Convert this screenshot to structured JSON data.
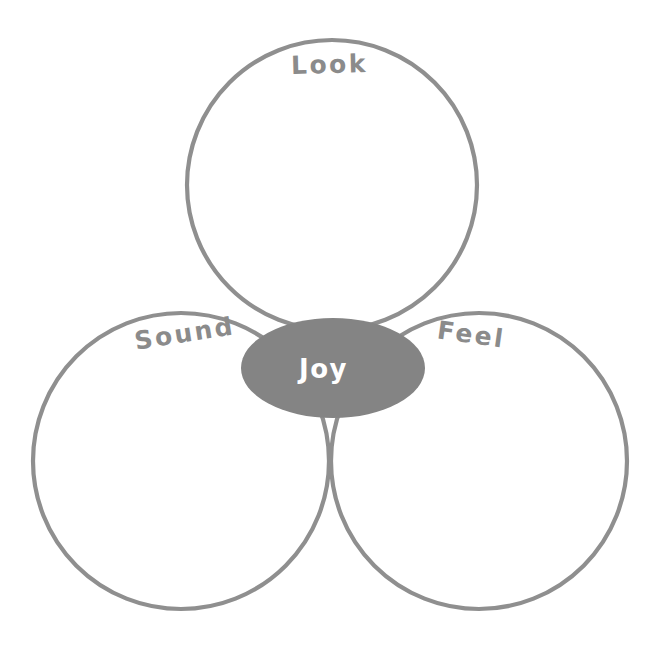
{
  "diagram": {
    "type": "venn-trefoil",
    "background_color": "#ffffff",
    "stroke_color": "#8f8f8f",
    "stroke_width": 4.2,
    "center_fill_color": "#848484",
    "center_text_color": "#ffffff",
    "label_text_color": "#8b8b8b",
    "canvas": {
      "width": 662,
      "height": 655
    },
    "center": {
      "label": "Joy",
      "shape": "ellipse",
      "cx": 333,
      "cy": 368,
      "rx": 92,
      "ry": 50
    },
    "lobes": [
      {
        "id": "look",
        "label": "Look",
        "shape": "circle",
        "cx": 332,
        "cy": 185,
        "r": 145,
        "position": "top"
      },
      {
        "id": "sound",
        "label": "Sound",
        "shape": "circle",
        "cx": 181,
        "cy": 461,
        "r": 148,
        "position": "bottom-left"
      },
      {
        "id": "feel",
        "label": "Feel",
        "shape": "circle",
        "cx": 479,
        "cy": 461,
        "r": 148,
        "position": "bottom-right"
      }
    ]
  },
  "chart_data": {
    "type": "diagram",
    "categories": [
      "Look",
      "Sound",
      "Feel"
    ],
    "center": "Joy",
    "values": [
      1,
      1,
      1
    ],
    "xlabel": "",
    "ylabel": ""
  }
}
